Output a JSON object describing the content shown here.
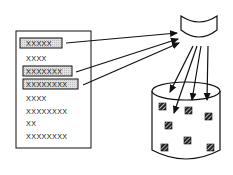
{
  "diagram": {
    "list": {
      "items": [
        {
          "label": "XXXXX",
          "highlighted": true
        },
        {
          "label": "XXXX",
          "highlighted": false
        },
        {
          "label": "XXXXXXX",
          "highlighted": true
        },
        {
          "label": "XXXXXXXX",
          "highlighted": true
        },
        {
          "label": "XXXX",
          "highlighted": false
        },
        {
          "label": "XXXXXXXX",
          "highlighted": false
        },
        {
          "label": "XX",
          "highlighted": false
        },
        {
          "label": "XXXXXXXX",
          "highlighted": false
        }
      ]
    },
    "funnel": {
      "shape": "bowl"
    },
    "container": {
      "shape": "cylinder",
      "item_count": 7
    },
    "colors": {
      "stroke": "#111111",
      "highlight_fill": "#d9d9d9",
      "square_fill": "#2a2a2a",
      "background": "#ffffff"
    }
  }
}
